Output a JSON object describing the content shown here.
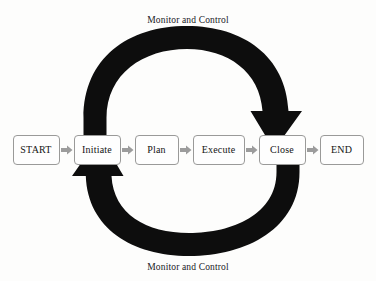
{
  "diagram": {
    "background_color": "#fdfdfc",
    "arc_color": "#0d0d0d",
    "box_border_color": "#9a9a99",
    "connector_color": "#9c9c9c",
    "text_color": "#141414"
  },
  "captions": {
    "top": "Monitor and Control",
    "bottom": "Monitor and Control"
  },
  "stages": [
    {
      "label": "START",
      "name": "start",
      "width_class": "w-start"
    },
    {
      "label": "Initiate",
      "name": "initiate",
      "width_class": "w-initiate"
    },
    {
      "label": "Plan",
      "name": "plan",
      "width_class": "w-plan"
    },
    {
      "label": "Execute",
      "name": "execute",
      "width_class": "w-execute"
    },
    {
      "label": "Close",
      "name": "close",
      "width_class": "w-close"
    },
    {
      "label": "END",
      "name": "end",
      "width_class": "w-end"
    }
  ],
  "connectors": [
    {
      "name": "connector-start-to-initiate",
      "icon": "arrow-right-icon"
    },
    {
      "name": "connector-initiate-to-plan",
      "icon": "arrow-right-icon"
    },
    {
      "name": "connector-plan-to-execute",
      "icon": "arrow-right-icon"
    },
    {
      "name": "connector-execute-to-close",
      "icon": "arrow-right-icon"
    },
    {
      "name": "connector-close-to-end",
      "icon": "arrow-right-icon"
    }
  ],
  "arcs": [
    {
      "name": "top-feedback-arc",
      "icon": "curved-arrow-clockwise-icon",
      "from": "Initiate",
      "to": "Close",
      "direction": "clockwise",
      "label": "Monitor and Control"
    },
    {
      "name": "bottom-feedback-arc",
      "icon": "curved-arrow-counterclockwise-icon",
      "from": "Close",
      "to": "Initiate",
      "direction": "counter-clockwise",
      "label": "Monitor and Control"
    }
  ]
}
